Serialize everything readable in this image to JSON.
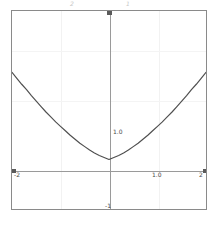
{
  "figure": {
    "background_color": "#ffffff",
    "frame_color": "#8a8a8a",
    "axis_color": "#9a9a9a",
    "grid_color": "#f2f2f2",
    "curve_color": "#4f4f4f"
  },
  "annotations": {
    "top_left": "2",
    "top_right": "1"
  },
  "chart_data": {
    "type": "line",
    "title": "",
    "subtitle": "",
    "xlabel": "",
    "ylabel": "",
    "xlim": [
      -2,
      2
    ],
    "ylim": [
      -1,
      3
    ],
    "grid": true,
    "legend_position": "none",
    "x_tick_labels": [
      "-2",
      "1.0",
      "2"
    ],
    "y_tick_labels": [
      "3",
      "1.0",
      "-1"
    ],
    "x_gridlines": [
      -1,
      1
    ],
    "y_gridlines": [
      1,
      2
    ],
    "series": [
      {
        "name": "curve",
        "color": "#4f4f4f",
        "x": [
          -2.0,
          -1.9,
          -1.8,
          -1.7,
          -1.6,
          -1.5,
          -1.4,
          -1.3,
          -1.2,
          -1.1,
          -1.0,
          -0.9,
          -0.8,
          -0.7,
          -0.6,
          -0.5,
          -0.4,
          -0.3,
          -0.2,
          -0.1,
          0.0,
          0.1,
          0.2,
          0.3,
          0.4,
          0.5,
          0.6,
          0.7,
          0.8,
          0.9,
          1.0,
          1.1,
          1.2,
          1.3,
          1.4,
          1.5,
          1.6,
          1.7,
          1.8,
          1.9,
          2.0
        ],
        "y": [
          1.76,
          1.64,
          1.52,
          1.41,
          1.29,
          1.18,
          1.07,
          0.96,
          0.86,
          0.76,
          0.67,
          0.58,
          0.49,
          0.41,
          0.33,
          0.26,
          0.19,
          0.13,
          0.08,
          0.04,
          0.0,
          0.04,
          0.08,
          0.13,
          0.19,
          0.26,
          0.33,
          0.41,
          0.49,
          0.58,
          0.67,
          0.76,
          0.86,
          0.96,
          1.07,
          1.18,
          1.29,
          1.41,
          1.52,
          1.64,
          1.76
        ]
      }
    ]
  },
  "labels": {
    "x_neg2": "-2",
    "x_pos2": "2",
    "x_one": "1.0",
    "y_one": "1.0",
    "y_neg1": "-1",
    "y_top": "3"
  }
}
